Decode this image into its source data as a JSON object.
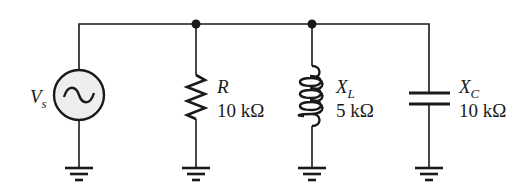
{
  "diagram": {
    "type": "parallel RLC circuit",
    "colors": {
      "line": "#1a1a1a",
      "source_fill": "#eeeeee",
      "background": "#ffffff"
    },
    "source": {
      "symbol": "V",
      "subscript": "s",
      "icon": "ac-source-icon"
    },
    "components": [
      {
        "id": "R",
        "symbol": "R",
        "subscript": "",
        "value": "10 kΩ",
        "icon": "resistor-icon"
      },
      {
        "id": "XL",
        "symbol": "X",
        "subscript": "L",
        "value": "5 kΩ",
        "icon": "inductor-icon"
      },
      {
        "id": "XC",
        "symbol": "X",
        "subscript": "C",
        "value": "10 kΩ",
        "icon": "capacitor-icon"
      }
    ],
    "nodes": 2,
    "grounds": 4
  }
}
